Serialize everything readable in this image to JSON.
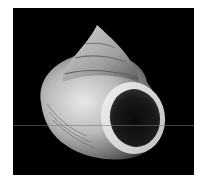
{
  "image": {
    "subject": "sea snail shell (top shell) photographed on black background",
    "alt": "Sea snail shell with conical spire and large rounded aperture on black background",
    "colors": {
      "page_background": "#ffffff",
      "photo_background": "#000000",
      "shell_light": "#e4e4e4",
      "shell_mid": "#a8a8a8",
      "shell_dark": "#555555",
      "aperture_interior": "#141414"
    }
  }
}
